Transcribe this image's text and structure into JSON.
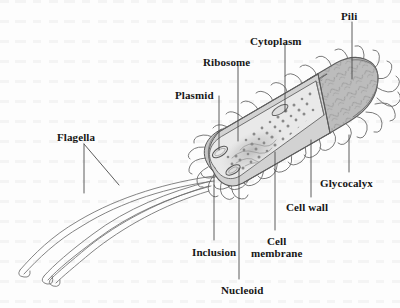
{
  "figure": {
    "kind": "prokaryotic-cell-diagram",
    "background_color": "#fdfdfd",
    "line_color": "#555555",
    "label_color": "#161616"
  },
  "palette": {
    "glycocalyx_fill": "#b9b9b9",
    "cell_wall_fill": "#c9c9c9",
    "membrane_fill": "#d6d6d6",
    "cytoplasm_fill": "#e9e9e9",
    "cut_face_fill": "#d0d0d0",
    "ribosome_dot": "#8d8d8d",
    "outline": "#555555",
    "leader_line": "#4a4a4a"
  },
  "labels": [
    {
      "id": "flagella",
      "text": "Flagella",
      "x": 57,
      "y": 132,
      "align": "left"
    },
    {
      "id": "plasmid",
      "text": "Plasmid",
      "x": 175,
      "y": 90,
      "align": "left"
    },
    {
      "id": "ribosome",
      "text": "Ribosome",
      "x": 203,
      "y": 57,
      "align": "left"
    },
    {
      "id": "cytoplasm",
      "text": "Cytoplasm",
      "x": 250,
      "y": 36,
      "align": "left"
    },
    {
      "id": "pili",
      "text": "Pili",
      "x": 341,
      "y": 11,
      "align": "left"
    },
    {
      "id": "glycocalyx",
      "text": "Glycocalyx",
      "x": 320,
      "y": 178,
      "align": "left"
    },
    {
      "id": "cell-wall",
      "text": "Cell wall",
      "x": 286,
      "y": 202,
      "align": "left"
    },
    {
      "id": "cell-membrane",
      "text": "Cell\nmembrane",
      "x": 251,
      "y": 236,
      "align": "center"
    },
    {
      "id": "inclusion",
      "text": "Inclusion",
      "x": 192,
      "y": 247,
      "align": "left"
    },
    {
      "id": "nucleoid",
      "text": "Nucleoid",
      "x": 221,
      "y": 285,
      "align": "left"
    }
  ],
  "leaders": [
    {
      "id": "leader-flagella-left",
      "path": "M 84 144 L 84 193"
    },
    {
      "id": "leader-flagella-right",
      "path": "M 84 144 L 119 185"
    },
    {
      "id": "leader-plasmid",
      "path": "M 219 96 L 219 152"
    },
    {
      "id": "leader-ribosome",
      "path": "M 238 66 L 238 141"
    },
    {
      "id": "leader-cytoplasm",
      "path": "M 285 44 L 285 112"
    },
    {
      "id": "leader-pili",
      "path": "M 352 22 L 352 79"
    },
    {
      "id": "leader-glycocalyx",
      "path": "M 349 172 L 349 135"
    },
    {
      "id": "leader-cell-wall",
      "path": "M 311 197 L 311 140"
    },
    {
      "id": "leader-cell-membrane",
      "path": "M 275 230 L 275 152"
    },
    {
      "id": "leader-inclusion",
      "path": "M 214 240 L 214 174"
    },
    {
      "id": "leader-nucleoid",
      "path": "M 239 279 L 239 168"
    }
  ],
  "structures": [
    {
      "id": "glycocalyx-layer",
      "name": "Glycocalyx",
      "description": "Outermost squiggle-textured gray capsule layer"
    },
    {
      "id": "cell-wall-layer",
      "name": "Cell wall",
      "description": "Rigid layer beneath the glycocalyx, shown as a concentric ring at the cut face"
    },
    {
      "id": "cell-membrane-layer",
      "name": "Cell membrane",
      "description": "Innermost boundary layer at the cut face"
    },
    {
      "id": "cytoplasm-region",
      "name": "Cytoplasm",
      "description": "Light gray interior filling the cutaway"
    },
    {
      "id": "ribosome-dots",
      "name": "Ribosome",
      "description": "Scattered dark dots throughout the cytoplasm"
    },
    {
      "id": "nucleoid-region",
      "name": "Nucleoid",
      "description": "Diffuse tangled DNA region in the cytoplasm"
    },
    {
      "id": "plasmid-ring",
      "name": "Plasmid",
      "description": "Small closed circular DNA loop"
    },
    {
      "id": "inclusion-body",
      "name": "Inclusion",
      "description": "Small oval storage granule"
    },
    {
      "id": "pili-appendages",
      "name": "Pili",
      "description": "Many short wavy hair-like projections around the cell surface"
    },
    {
      "id": "flagella-appendages",
      "name": "Flagella",
      "description": "Three long curved whip-like tails from the left pole"
    }
  ]
}
